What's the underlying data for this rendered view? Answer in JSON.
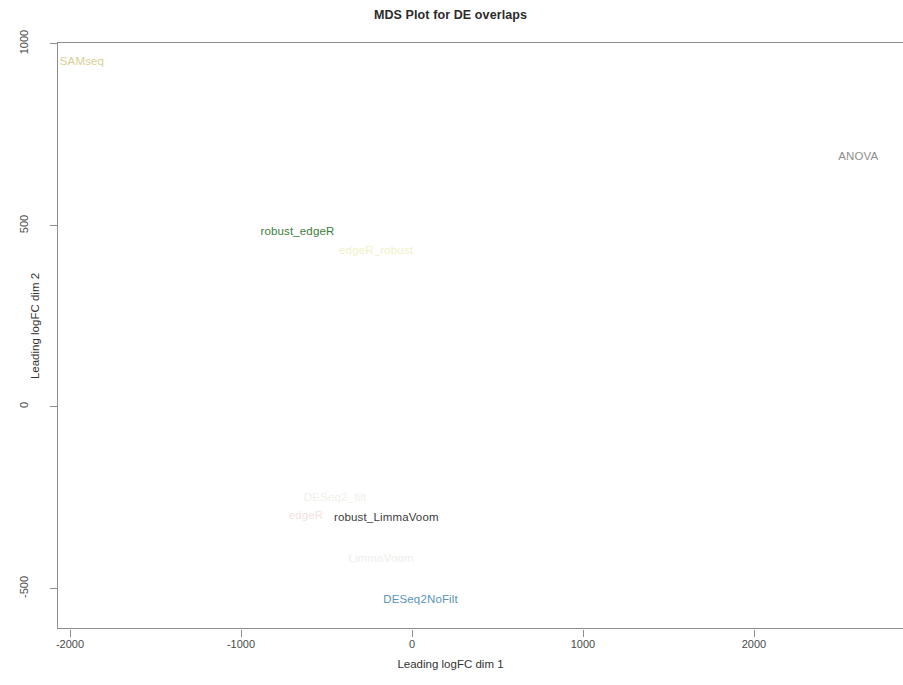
{
  "chart_data": {
    "type": "scatter",
    "title": "MDS Plot for DE overlaps",
    "xlabel": "Leading logFC dim 1",
    "ylabel": "Leading logFC dim 2",
    "xlim": [
      -2110,
      2840
    ],
    "ylim": [
      -620,
      1010
    ],
    "xticks": [
      -2000,
      -1000,
      0,
      1000,
      2000
    ],
    "xticklabels": [
      "-2000",
      "-1000",
      "0",
      "1000",
      "2000"
    ],
    "yticks": [
      1000,
      500,
      0,
      -500
    ],
    "yticklabels": [
      "1000",
      "500",
      "0",
      "-500"
    ],
    "grid": false,
    "legend": null,
    "marker_style": "text-labels-only",
    "points": [
      {
        "label": "SAMseq",
        "x": -1930,
        "y": 950,
        "color": "#d8cf92"
      },
      {
        "label": "ANOVA",
        "x": 2610,
        "y": 690,
        "color": "#8e8e8e"
      },
      {
        "label": "robust_edgeR",
        "x": -670,
        "y": 483,
        "color": "#3c7d3c"
      },
      {
        "label": "edgeR_robust",
        "x": -210,
        "y": 430,
        "color": "#f2f0c8"
      },
      {
        "label": "DESeq2_filt",
        "x": -450,
        "y": -250,
        "color": "#f3f0ea"
      },
      {
        "label": "edgeR",
        "x": -620,
        "y": -300,
        "color": "#f5e3e0"
      },
      {
        "label": "robust_LimmaVoom",
        "x": -150,
        "y": -307,
        "color": "#3b3b3b"
      },
      {
        "label": "LimmaVoom",
        "x": -180,
        "y": -420,
        "color": "#f0eeea"
      },
      {
        "label": "DESeq2NoFilt",
        "x": 50,
        "y": -532,
        "color": "#5b93b8"
      }
    ]
  }
}
